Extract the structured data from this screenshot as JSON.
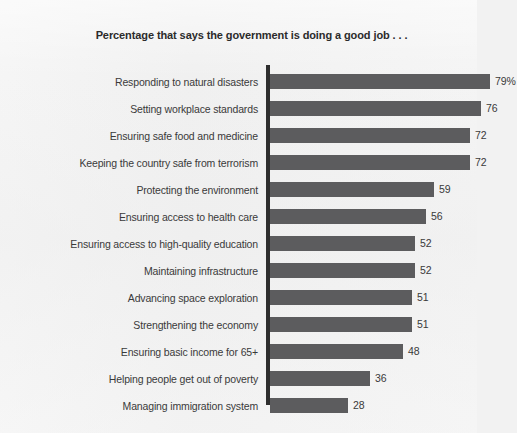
{
  "chart_data": {
    "type": "bar",
    "orientation": "horizontal",
    "title": "Percentage that says the government is doing a good job . . .",
    "xlabel": "",
    "ylabel": "",
    "xlim": [
      0,
      100
    ],
    "grid": false,
    "legend": null,
    "unit": "%",
    "bar_color": "#5c5c5e",
    "background_color": "#f2f2f2",
    "text_color": "#3a3a3a",
    "categories": [
      "Responding to natural disasters",
      "Setting workplace standards",
      "Ensuring safe food and medicine",
      "Keeping the country safe from terrorism",
      "Protecting the environment",
      "Ensuring access to health care",
      "Ensuring access to high-quality education",
      "Maintaining infrastructure",
      "Advancing space exploration",
      "Strengthening the economy",
      "Ensuring basic income for 65+",
      "Helping people get out of poverty",
      "Managing immigration system"
    ],
    "values": [
      79,
      76,
      72,
      72,
      59,
      56,
      52,
      52,
      51,
      51,
      48,
      36,
      28
    ],
    "value_labels": [
      "79%",
      "76",
      "72",
      "72",
      "59",
      "56",
      "52",
      "52",
      "51",
      "51",
      "48",
      "36",
      "28"
    ]
  }
}
